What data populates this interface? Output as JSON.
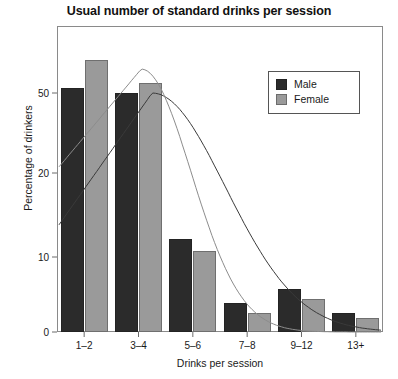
{
  "chart_data": {
    "type": "bar",
    "title": "Usual number of standard drinks per session",
    "xlabel": "Drinks per session",
    "ylabel": "Percentage of drinkers",
    "categories": [
      "1–2",
      "3–4",
      "5–6",
      "7–8",
      "9–12",
      "13+"
    ],
    "series": [
      {
        "name": "Male",
        "color": "#2b2b2b",
        "values": [
          51,
          50,
          19.5,
          6,
          9,
          4
        ]
      },
      {
        "name": "Female",
        "color": "#9a9a9a",
        "values": [
          57,
          52,
          17,
          4,
          7,
          3
        ]
      }
    ],
    "ytick_labels": [
      "0",
      "10",
      "20",
      "50"
    ],
    "ytick_values": [
      0,
      10,
      20,
      50
    ],
    "ylim": [
      0,
      60
    ],
    "grid": false,
    "legend_position": "top-right",
    "legend_entries": [
      "Male",
      "Female"
    ],
    "annotations": [
      "Two smooth fitted distribution curves overlaid on the bars"
    ]
  }
}
